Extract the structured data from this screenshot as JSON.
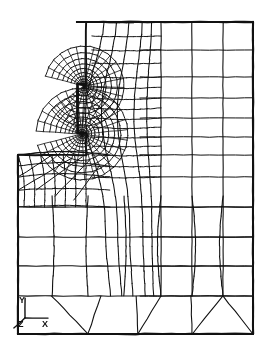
{
  "figure": {
    "type": "fe-mesh",
    "background_color": "#ffffff",
    "line_color": "#111111",
    "width": 272,
    "height": 356
  },
  "axis_triad": {
    "name": "coordinate-axis-triad",
    "origin": [
      25,
      318
    ],
    "labels": {
      "y": "Y",
      "z": "Z",
      "x": "X"
    },
    "axes": [
      {
        "label": "Y",
        "from": [
          25,
          318
        ],
        "to": [
          25,
          298
        ]
      },
      {
        "label": "Z",
        "from": [
          25,
          318
        ],
        "to": [
          14,
          328
        ]
      },
      {
        "label": "X",
        "from": [
          25,
          318
        ],
        "to": [
          48,
          318
        ]
      }
    ]
  },
  "chart_data": {
    "type": "mesh",
    "xlabel": "X",
    "ylabel": "Y",
    "grid": true,
    "legend": false,
    "outline": [
      [
        77,
        22
      ],
      [
        253,
        22
      ],
      [
        253,
        334
      ],
      [
        18,
        334
      ],
      [
        18,
        155
      ],
      [
        86,
        155
      ],
      [
        86,
        133
      ],
      [
        78,
        133
      ],
      [
        78,
        84
      ],
      [
        86,
        84
      ],
      [
        86,
        22
      ]
    ],
    "coarse_vertical_lines_x": [
      161,
      192,
      223,
      253
    ],
    "coarse_horizontal_lines_y": [
      22,
      50,
      77,
      98,
      118,
      137,
      155,
      177,
      207,
      237,
      266,
      296,
      334
    ],
    "left_block_top_y": 155,
    "upper_block_left_x": 77,
    "notch_tips": [
      {
        "name": "upper-notch-tip",
        "x": 84,
        "y": 86
      },
      {
        "name": "lower-notch-tip",
        "x": 82,
        "y": 134
      }
    ],
    "refined_zones": [
      {
        "name": "upper-refinement-fan",
        "center": [
          84,
          86
        ],
        "radius": 34,
        "rings": 14,
        "rays": 26
      },
      {
        "name": "lower-refinement-fan",
        "center": [
          82,
          134
        ],
        "radius": 40,
        "rings": 14,
        "rays": 28
      }
    ],
    "bottom_transition_nodes": [
      [
        101,
        296
      ],
      [
        136,
        296
      ],
      [
        191,
        296
      ],
      [
        223,
        296
      ]
    ],
    "bottom_transition_feet": [
      [
        88,
        334
      ],
      [
        138,
        334
      ],
      [
        192,
        334
      ],
      [
        253,
        334
      ]
    ]
  }
}
